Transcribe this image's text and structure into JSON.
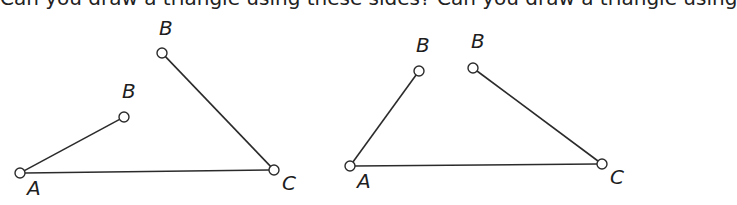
{
  "header": {
    "clipped_text": "Can you draw a triangle using these sides? Can you draw a triangle using"
  },
  "colors": {
    "stroke": "#2b2b2b",
    "point_fill": "#ffffff",
    "label": "#1e1e1e"
  },
  "figures": [
    {
      "name": "left-figure",
      "points": {
        "A": {
          "x": 20,
          "y": 173,
          "label": "A",
          "lx": 27,
          "ly": 195
        },
        "C": {
          "x": 274,
          "y": 170,
          "label": "C",
          "lx": 282,
          "ly": 190
        },
        "B1": {
          "x": 162,
          "y": 53,
          "label": "B",
          "lx": 159,
          "ly": 35
        },
        "B2": {
          "x": 124,
          "y": 117,
          "label": "B",
          "lx": 122,
          "ly": 98
        }
      },
      "segments": [
        [
          "A",
          "C"
        ],
        [
          "A",
          "B2"
        ],
        [
          "C",
          "B1"
        ]
      ]
    },
    {
      "name": "right-figure",
      "points": {
        "A": {
          "x": 350,
          "y": 166,
          "label": "A",
          "lx": 357,
          "ly": 188
        },
        "C": {
          "x": 602,
          "y": 164,
          "label": "C",
          "lx": 610,
          "ly": 184
        },
        "B1": {
          "x": 419,
          "y": 71,
          "label": "B",
          "lx": 416,
          "ly": 52
        },
        "B2": {
          "x": 473,
          "y": 68,
          "label": "B",
          "lx": 471,
          "ly": 48
        }
      },
      "segments": [
        [
          "A",
          "C"
        ],
        [
          "A",
          "B1"
        ],
        [
          "C",
          "B2"
        ]
      ]
    }
  ]
}
